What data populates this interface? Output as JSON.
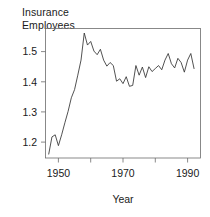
{
  "figure": {
    "title_line1": "Insurance",
    "title_line2": "Employees",
    "title": "Insurance\nEmployees",
    "xlabel": "Year",
    "background_color": "#ffffff",
    "line_color": "#333333",
    "axis_color": "#6b6b6b"
  },
  "chart_data": {
    "type": "line",
    "title": "Insurance Employees",
    "xlabel": "Year",
    "ylabel": "",
    "grid": false,
    "legend": null,
    "xlim": [
      1946,
      1994
    ],
    "ylim": [
      1.145,
      1.575
    ],
    "xticks": [
      1950,
      1960,
      1970,
      1980,
      1990
    ],
    "xtick_labels": [
      "1950",
      "",
      "1970",
      "",
      "1990"
    ],
    "yticks": [
      1.2,
      1.3,
      1.4,
      1.5
    ],
    "ytick_labels": [
      "1.2",
      "1.3",
      "1.4",
      "1.5"
    ],
    "series": [
      {
        "name": "Insurance Employees",
        "x": [
          1947,
          1948,
          1949,
          1950,
          1951,
          1952,
          1953,
          1954,
          1955,
          1956,
          1957,
          1958,
          1959,
          1960,
          1961,
          1962,
          1963,
          1964,
          1965,
          1966,
          1967,
          1968,
          1969,
          1970,
          1971,
          1972,
          1973,
          1974,
          1975,
          1976,
          1977,
          1978,
          1979,
          1980,
          1981,
          1982,
          1983,
          1984,
          1985,
          1986,
          1987,
          1988,
          1989,
          1990,
          1991,
          1992
        ],
        "values": [
          1.158,
          1.215,
          1.222,
          1.186,
          1.222,
          1.262,
          1.3,
          1.345,
          1.372,
          1.42,
          1.47,
          1.56,
          1.52,
          1.532,
          1.5,
          1.488,
          1.506,
          1.47,
          1.45,
          1.462,
          1.452,
          1.4,
          1.408,
          1.392,
          1.415,
          1.383,
          1.386,
          1.452,
          1.42,
          1.447,
          1.412,
          1.448,
          1.432,
          1.442,
          1.452,
          1.438,
          1.47,
          1.492,
          1.458,
          1.444,
          1.476,
          1.462,
          1.43,
          1.47,
          1.492,
          1.442
        ]
      }
    ]
  },
  "axis": {
    "y_tick_1": "1.2",
    "y_tick_2": "1.3",
    "y_tick_3": "1.4",
    "y_tick_4": "1.5",
    "x_tick_1": "1950",
    "x_tick_2": "1970",
    "x_tick_3": "1990"
  }
}
